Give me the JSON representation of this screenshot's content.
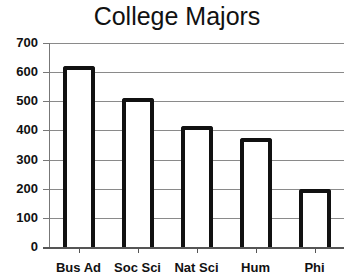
{
  "chart_data": {
    "type": "bar",
    "title": "College Majors",
    "xlabel": "",
    "ylabel": "",
    "categories": [
      "Bus Ad",
      "Soc Sci",
      "Nat Sci",
      "Hum",
      "Phi"
    ],
    "values": [
      620,
      510,
      415,
      375,
      200
    ],
    "ylim": [
      0,
      700
    ],
    "yticks": [
      "0",
      "100",
      "200",
      "300",
      "400",
      "500",
      "600",
      "700"
    ],
    "grid": true,
    "legend": "none"
  }
}
